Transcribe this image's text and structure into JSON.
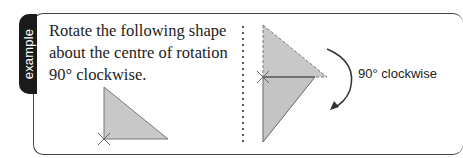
{
  "tab": {
    "label": "example"
  },
  "question": {
    "text": "Rotate the following shape about the centre of rotation 90° clockwise."
  },
  "answer": {
    "rotation_label": "90° clockwise"
  },
  "colors": {
    "shape_fill": "#c8c8c8",
    "tab_bg": "#1a1a1a",
    "border": "#444444"
  }
}
